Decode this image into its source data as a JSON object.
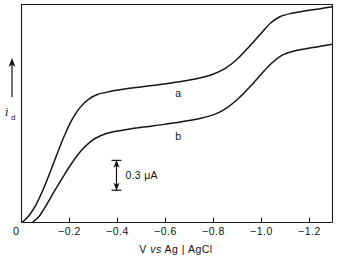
{
  "chart_data": {
    "type": "line",
    "title": "",
    "xlabel": "V vs Ag | AgCl",
    "xlabel_parts": {
      "pre": "V ",
      "italic": "vs",
      "post": " Ag | AgCl"
    },
    "ylabel": "i_d",
    "ylabel_symbol": "i",
    "ylabel_subscript": "d",
    "ylabel_has_up_arrow": true,
    "x_ticks": [
      0,
      -0.2,
      -0.4,
      -0.6,
      -0.8,
      -1.0,
      -1.2
    ],
    "x_tick_labels": [
      "0",
      "-0.2",
      "-0.4",
      "-0.6",
      "-0.8",
      "-1.0",
      "-1.2"
    ],
    "origin_label": "0",
    "xlim": [
      0,
      -1.3
    ],
    "y_axis_numeric_scale": false,
    "ylim_arbitrary": [
      0,
      1
    ],
    "grid": false,
    "legend_position": "inline-curve-labels",
    "scale_bar": {
      "label": "0.3 μA",
      "value": 0.3,
      "units": "μA",
      "orientation": "vertical",
      "double_headed": true,
      "at_x_volts": -0.395,
      "top_y_frac": 0.285,
      "bottom_y_frac": 0.148
    },
    "series": [
      {
        "name": "a",
        "label": "a",
        "label_at": {
          "x_volts": -0.655,
          "y_frac": 0.575
        },
        "points_xy_volts_frac": [
          [
            -0.005,
            0.003
          ],
          [
            -0.03,
            0.03
          ],
          [
            -0.06,
            0.08
          ],
          [
            -0.09,
            0.15
          ],
          [
            -0.12,
            0.232
          ],
          [
            -0.15,
            0.318
          ],
          [
            -0.18,
            0.4
          ],
          [
            -0.21,
            0.47
          ],
          [
            -0.245,
            0.528
          ],
          [
            -0.28,
            0.565
          ],
          [
            -0.32,
            0.588
          ],
          [
            -0.37,
            0.601
          ],
          [
            -0.43,
            0.612
          ],
          [
            -0.5,
            0.622
          ],
          [
            -0.58,
            0.633
          ],
          [
            -0.66,
            0.646
          ],
          [
            -0.74,
            0.662
          ],
          [
            -0.8,
            0.68
          ],
          [
            -0.85,
            0.706
          ],
          [
            -0.9,
            0.748
          ],
          [
            -0.95,
            0.805
          ],
          [
            -1.0,
            0.866
          ],
          [
            -1.04,
            0.914
          ],
          [
            -1.08,
            0.944
          ],
          [
            -1.13,
            0.96
          ],
          [
            -1.19,
            0.971
          ],
          [
            -1.25,
            0.981
          ],
          [
            -1.3,
            0.99
          ]
        ]
      },
      {
        "name": "b",
        "label": "b",
        "label_at": {
          "x_volts": -0.655,
          "y_frac": 0.378
        },
        "points_xy_volts_frac": [
          [
            -0.048,
            0.003
          ],
          [
            -0.075,
            0.03
          ],
          [
            -0.105,
            0.082
          ],
          [
            -0.14,
            0.148
          ],
          [
            -0.175,
            0.212
          ],
          [
            -0.21,
            0.272
          ],
          [
            -0.25,
            0.33
          ],
          [
            -0.29,
            0.372
          ],
          [
            -0.33,
            0.398
          ],
          [
            -0.38,
            0.415
          ],
          [
            -0.44,
            0.427
          ],
          [
            -0.51,
            0.438
          ],
          [
            -0.59,
            0.449
          ],
          [
            -0.67,
            0.462
          ],
          [
            -0.75,
            0.478
          ],
          [
            -0.81,
            0.497
          ],
          [
            -0.86,
            0.527
          ],
          [
            -0.91,
            0.572
          ],
          [
            -0.96,
            0.628
          ],
          [
            -1.01,
            0.69
          ],
          [
            -1.05,
            0.735
          ],
          [
            -1.09,
            0.768
          ],
          [
            -1.14,
            0.787
          ],
          [
            -1.2,
            0.799
          ],
          [
            -1.25,
            0.808
          ],
          [
            -1.3,
            0.818
          ]
        ]
      }
    ]
  }
}
